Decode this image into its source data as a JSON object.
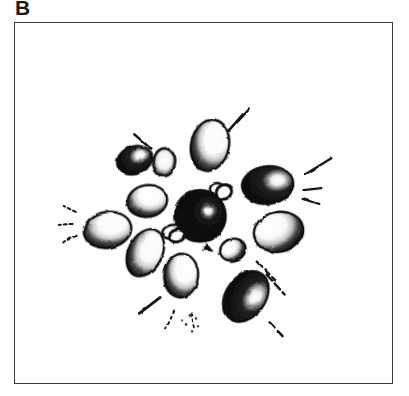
{
  "figure": {
    "panel_label": "B",
    "frame": {
      "x": 14,
      "y": 22,
      "width": 379,
      "height": 362,
      "border_color": "#3b3b3b",
      "border_width": 1.5
    },
    "background_color": "#ffffff",
    "ink_color": "#121212",
    "highlight_color": "#ffffff",
    "midtone_color": "#6e6e6e"
  },
  "chart_data": {
    "type": "scatter",
    "title": "B",
    "subtitle": "",
    "xlabel": "",
    "ylabel": "",
    "grid": false,
    "legend_position": "none",
    "xlim": [
      0,
      379
    ],
    "ylim": [
      0,
      362
    ],
    "center": {
      "x": 186,
      "y": 194,
      "radius": 25,
      "fill": "dark"
    },
    "series": [
      {
        "name": "dark-bodies",
        "fill": "dark",
        "points": [
          {
            "id": "body-center",
            "x": 186,
            "y": 194,
            "rx": 26,
            "ry": 25,
            "rot": 0,
            "tone": "dark",
            "highlight": "right"
          },
          {
            "id": "body-upper-left",
            "x": 120,
            "y": 138,
            "rx": 18,
            "ry": 14,
            "rot": -22,
            "tone": "dark",
            "highlight": "right"
          },
          {
            "id": "body-right",
            "x": 254,
            "y": 163,
            "rx": 26,
            "ry": 19,
            "rot": -6,
            "tone": "dark",
            "highlight": "right"
          },
          {
            "id": "body-lower-right",
            "x": 232,
            "y": 275,
            "rx": 20,
            "ry": 28,
            "rot": 36,
            "tone": "dark",
            "highlight": "right"
          }
        ]
      },
      {
        "name": "light-bodies",
        "fill": "light",
        "points": [
          {
            "id": "body-top",
            "x": 196,
            "y": 123,
            "rx": 19,
            "ry": 26,
            "rot": 12,
            "tone": "light",
            "highlight": "upper-right"
          },
          {
            "id": "body-top-small",
            "x": 150,
            "y": 140,
            "rx": 11,
            "ry": 14,
            "rot": 4,
            "tone": "ring",
            "highlight": "center"
          },
          {
            "id": "body-left-upper",
            "x": 133,
            "y": 179,
            "rx": 20,
            "ry": 16,
            "rot": -10,
            "tone": "light",
            "highlight": "upper-right"
          },
          {
            "id": "body-left",
            "x": 93,
            "y": 208,
            "rx": 24,
            "ry": 18,
            "rot": -10,
            "tone": "light",
            "highlight": "upper-right"
          },
          {
            "id": "body-left-lower",
            "x": 131,
            "y": 231,
            "rx": 17,
            "ry": 25,
            "rot": 26,
            "tone": "light",
            "highlight": "upper-right"
          },
          {
            "id": "body-bottom",
            "x": 167,
            "y": 254,
            "rx": 17,
            "ry": 22,
            "rot": 6,
            "tone": "light",
            "highlight": "upper-right"
          },
          {
            "id": "body-right-lower",
            "x": 265,
            "y": 210,
            "rx": 25,
            "ry": 20,
            "rot": -12,
            "tone": "light",
            "highlight": "upper-left"
          },
          {
            "id": "body-inner-right",
            "x": 219,
            "y": 228,
            "rx": 13,
            "ry": 11,
            "rot": -18,
            "tone": "light",
            "highlight": "upper-left"
          },
          {
            "id": "body-inner-left",
            "x": 158,
            "y": 210,
            "rx": 10,
            "ry": 7,
            "rot": -12,
            "tone": "light",
            "highlight": "left"
          },
          {
            "id": "body-inner-top",
            "x": 203,
            "y": 167,
            "rx": 7,
            "ry": 6,
            "rot": 0,
            "tone": "ring",
            "highlight": "center"
          }
        ]
      }
    ],
    "radiating_marks": [
      {
        "id": "ray-nne",
        "x1": 215,
        "y1": 108,
        "x2": 229,
        "y2": 92
      },
      {
        "id": "ray-nne2",
        "x1": 224,
        "y1": 99,
        "x2": 236,
        "y2": 86
      },
      {
        "id": "ray-nw",
        "x1": 120,
        "y1": 112,
        "x2": 136,
        "y2": 126
      },
      {
        "id": "ray-ene",
        "x1": 292,
        "y1": 152,
        "x2": 318,
        "y2": 136
      },
      {
        "id": "ray-e1",
        "x1": 290,
        "y1": 168,
        "x2": 308,
        "y2": 166
      },
      {
        "id": "ray-e2",
        "x1": 289,
        "y1": 177,
        "x2": 306,
        "y2": 182
      },
      {
        "id": "ray-wnw",
        "x1": 61,
        "y1": 190,
        "x2": 49,
        "y2": 184
      },
      {
        "id": "ray-w",
        "x1": 58,
        "y1": 202,
        "x2": 44,
        "y2": 203
      },
      {
        "id": "ray-wsw",
        "x1": 62,
        "y1": 214,
        "x2": 48,
        "y2": 221
      },
      {
        "id": "ray-ese",
        "x1": 243,
        "y1": 240,
        "x2": 262,
        "y2": 259
      },
      {
        "id": "ray-ese2",
        "x1": 253,
        "y1": 253,
        "x2": 271,
        "y2": 273
      },
      {
        "id": "ray-sse",
        "x1": 256,
        "y1": 301,
        "x2": 271,
        "y2": 317
      },
      {
        "id": "ray-ssw",
        "x1": 160,
        "y1": 290,
        "x2": 152,
        "y2": 307
      },
      {
        "id": "ray-sw",
        "x1": 146,
        "y1": 276,
        "x2": 125,
        "y2": 292
      },
      {
        "id": "ray-s",
        "x1": 178,
        "y1": 292,
        "x2": 180,
        "y2": 309
      }
    ]
  }
}
